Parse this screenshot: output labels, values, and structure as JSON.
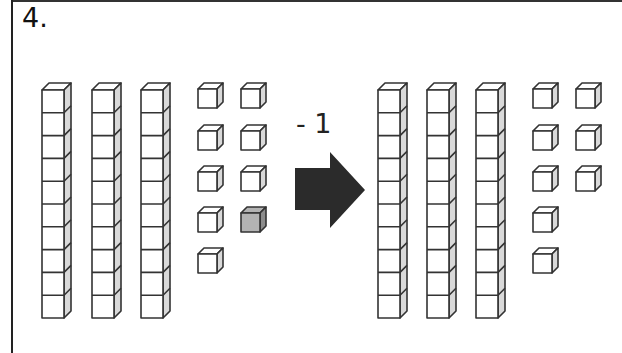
{
  "problem": {
    "number_label": "4.",
    "operation_label": "- 1",
    "arrow_icon": "right-arrow-icon"
  },
  "colors": {
    "outline": "#333333",
    "cube_face": "#ffffff",
    "cube_side": "#d9d9d9",
    "highlight_cube": "#b3b3b3",
    "highlight_cube_side": "#8c8c8c",
    "arrow": "#2b2b2b"
  },
  "before": {
    "tens_rods": 3,
    "cubes_per_rod": 10,
    "ones_cubes": 9,
    "ones_columns": [
      5,
      4
    ],
    "highlighted_cube": {
      "column": 2,
      "row": 4,
      "note": "shaded cube removed"
    },
    "value": 39
  },
  "after": {
    "tens_rods": 3,
    "cubes_per_rod": 10,
    "ones_cubes": 8,
    "ones_columns": [
      5,
      3
    ],
    "value": 38
  }
}
